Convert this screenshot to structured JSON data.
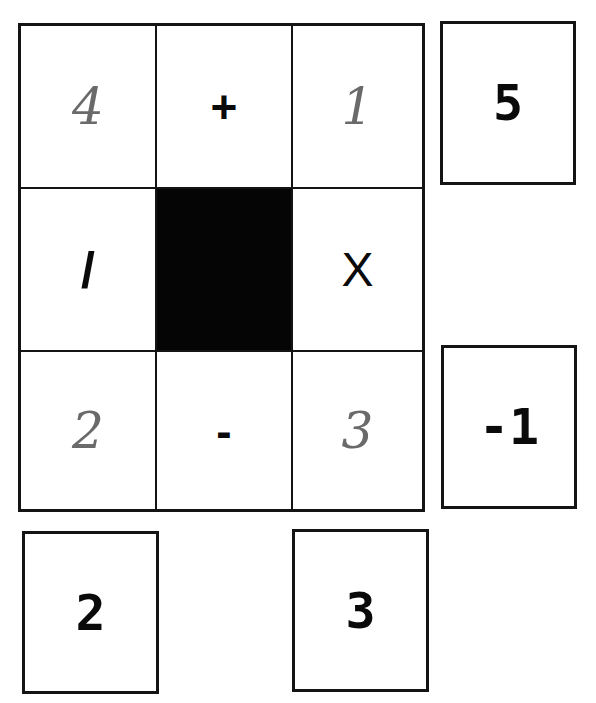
{
  "puzzle": {
    "grid": [
      [
        {
          "value": "4",
          "type": "handwritten-digit"
        },
        {
          "value": "+",
          "type": "operator"
        },
        {
          "value": "1",
          "type": "handwritten-digit"
        }
      ],
      [
        {
          "value": "/",
          "type": "operator"
        },
        {
          "value": "",
          "type": "blocked"
        },
        {
          "value": "X",
          "type": "operator"
        }
      ],
      [
        {
          "value": "2",
          "type": "handwritten-digit"
        },
        {
          "value": "-",
          "type": "operator"
        },
        {
          "value": "3",
          "type": "handwritten-digit"
        }
      ]
    ],
    "row_results": [
      {
        "row": 1,
        "value": "5"
      },
      {
        "row": 3,
        "value": "-1"
      }
    ],
    "column_results": [
      {
        "column": 1,
        "value": "2"
      },
      {
        "column": 3,
        "value": "3"
      }
    ],
    "colors": {
      "ink": "#0a0a0a",
      "pencil": "#6a6a6a",
      "paper": "#ffffff",
      "blocked": "#050505"
    }
  }
}
